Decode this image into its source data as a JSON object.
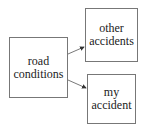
{
  "diagram": {
    "nodes": [
      {
        "id": "road",
        "label_line1": "road",
        "label_line2": "conditions"
      },
      {
        "id": "other",
        "label_line1": "other",
        "label_line2": "accidents"
      },
      {
        "id": "my",
        "label_line1": "my",
        "label_line2": "accident"
      }
    ],
    "edges": [
      {
        "from": "road",
        "to": "other"
      },
      {
        "from": "road",
        "to": "my"
      }
    ],
    "colors": {
      "border": "#777777",
      "arrow": "#333333",
      "text": "#222222"
    }
  }
}
